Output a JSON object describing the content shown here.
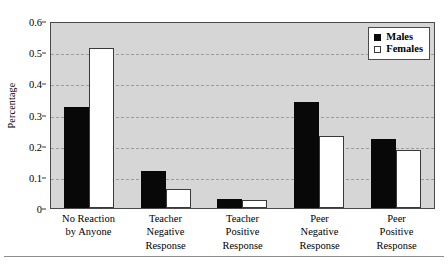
{
  "chart_data": {
    "type": "bar",
    "title": "",
    "subtitle": "",
    "xlabel": "",
    "ylabel": "Percentage",
    "ylim": [
      0,
      0.6
    ],
    "ytick_values": [
      "0.6",
      "0.5",
      "0.4",
      "0.3",
      "0.2",
      "0.1",
      "0"
    ],
    "grid": true,
    "grid_style": "dashed horizontal",
    "legend_position": "top-right inside plot",
    "categories": [
      "No Reaction by Anyone",
      "Teacher Negative Response",
      "Teacher Positive Response",
      "Peer Negative Response",
      "Peer Positive Response"
    ],
    "category_label_lines": [
      [
        "No Reaction",
        "by Anyone"
      ],
      [
        "Teacher",
        "Negative",
        "Response"
      ],
      [
        "Teacher",
        "Positive",
        "Response"
      ],
      [
        "Peer",
        "Negative",
        "Response"
      ],
      [
        "Peer",
        "Positive",
        "Response"
      ]
    ],
    "series": [
      {
        "name": "Males",
        "swatch": "filled-black-square",
        "color": "#0a0a0a",
        "values": [
          0.325,
          0.12,
          0.03,
          0.34,
          0.22
        ]
      },
      {
        "name": "Females",
        "swatch": "open-white-square",
        "color": "#ffffff",
        "values": [
          0.515,
          0.06,
          0.025,
          0.23,
          0.185
        ]
      }
    ],
    "colors": {
      "plot_background": "#d6d6d6",
      "page_background": "#ffffff",
      "axis": "#4a4a4a",
      "gridline": "#9d9d9d",
      "males_fill": "#0a0a0a",
      "females_fill": "#ffffff",
      "females_edge": "#3a3a3a"
    }
  },
  "legend": {
    "items": [
      {
        "label": "Males"
      },
      {
        "label": "Females"
      }
    ]
  }
}
